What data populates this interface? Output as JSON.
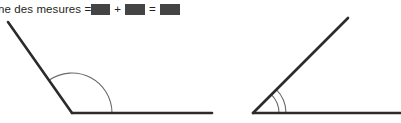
{
  "page": {
    "width": 401,
    "height": 123,
    "background": "#ffffff",
    "language": "fr"
  },
  "equation": {
    "label_text": "ne des mesures =",
    "label_note_clipped_at_left_edge": true,
    "plus_sign": "+",
    "equals_sign": "=",
    "blank_boxes": [
      {
        "name": "first-angle-measure-blank",
        "fill": "#444444"
      },
      {
        "name": "second-angle-measure-blank",
        "fill": "#444444"
      },
      {
        "name": "sum-of-measures-blank",
        "fill": "#444444"
      }
    ]
  },
  "figures": {
    "stroke_color": "#2b2b2b",
    "arc_color": "#6a6a6a",
    "left": {
      "name": "obtuse-angle-figure",
      "vertex": {
        "x": 72,
        "y": 113
      },
      "ray_a_end": {
        "x": 8,
        "y": 22
      },
      "ray_b_end": {
        "x": 212,
        "y": 113
      },
      "arc_count": 1,
      "arc_radius": 40,
      "angle_type": "obtuse"
    },
    "right": {
      "name": "acute-angle-figure",
      "vertex": {
        "x": 253,
        "y": 113
      },
      "ray_a_end": {
        "x": 348,
        "y": 18
      },
      "ray_b_end": {
        "x": 401,
        "y": 113
      },
      "arc_count": 2,
      "arc_radii": [
        26,
        33
      ],
      "angle_type": "acute"
    }
  }
}
